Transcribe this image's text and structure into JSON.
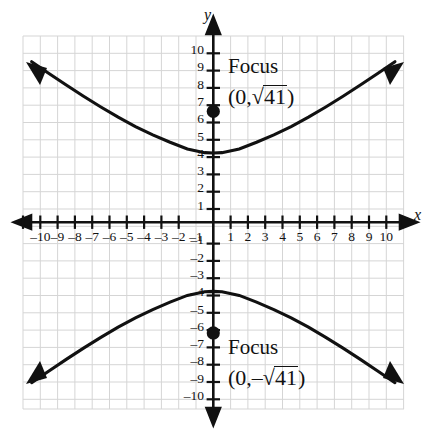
{
  "figure": {
    "title": "",
    "background_color": "#ffffff",
    "grid_color": "#d5d5d5",
    "axis_color": "#111111",
    "curve_color": "#111111"
  },
  "axes": {
    "x_name": "x",
    "y_name": "y",
    "x_ticks": [
      -10,
      -9,
      -8,
      -7,
      -6,
      -5,
      -4,
      -3,
      -2,
      -1,
      1,
      2,
      3,
      4,
      5,
      6,
      7,
      8,
      9,
      10
    ],
    "y_ticks": [
      10,
      9,
      8,
      7,
      6,
      5,
      4,
      3,
      2,
      1,
      -1,
      -2,
      -3,
      -4,
      -5,
      -6,
      -7,
      -8,
      -9,
      -10
    ],
    "x_tick_labels": [
      "–10",
      "–9",
      "–8",
      "–7",
      "–6",
      "–5",
      "–4",
      "–3",
      "–2",
      "–1",
      "1",
      "2",
      "3",
      "4",
      "5",
      "6",
      "7",
      "8",
      "9",
      "10"
    ],
    "y_tick_labels": [
      "10",
      "9",
      "8",
      "7",
      "6",
      "5",
      "4",
      "3",
      "2",
      "1",
      "–1",
      "–2",
      "–3",
      "–4",
      "–5",
      "–6",
      "–7",
      "–8",
      "–9",
      "–10"
    ]
  },
  "annotations": {
    "focus_top": {
      "label": "Focus",
      "coord_open": "(0,",
      "coord_sign": "",
      "radical_symbol": "√",
      "radicand": "41",
      "coord_close": ")"
    },
    "focus_bottom": {
      "label": "Focus",
      "coord_open": "(0,",
      "coord_sign": "–",
      "radical_symbol": "√",
      "radicand": "41",
      "coord_close": ")"
    }
  },
  "chart_data": {
    "type": "line",
    "title": "",
    "xlabel": "x",
    "ylabel": "y",
    "xlim": [
      -11,
      11
    ],
    "ylim": [
      -11,
      11
    ],
    "grid": true,
    "legend": "none",
    "equation": "y^2/16 - x^2/25 = 1",
    "a": 4,
    "b": 5,
    "c": 6.403,
    "vertices": [
      [
        0,
        4
      ],
      [
        0,
        -4
      ]
    ],
    "foci": [
      [
        0,
        6.403
      ],
      [
        0,
        -6.403
      ]
    ],
    "focus_labels": [
      "(0, √41)",
      "(0, –√41)"
    ],
    "points": [
      {
        "name": "focus-upper",
        "x": 0,
        "y": 6.403,
        "marker": "filled-circle"
      },
      {
        "name": "focus-lower",
        "x": 0,
        "y": -6.403,
        "marker": "filled-circle"
      }
    ],
    "series": [
      {
        "name": "upper-branch",
        "x": [
          -10.5,
          -9.5,
          -8.5,
          -7.5,
          -6.5,
          -5.5,
          -4.5,
          -3.5,
          -2.5,
          -1.5,
          -0.5,
          0,
          0.5,
          1.5,
          2.5,
          3.5,
          4.5,
          5.5,
          6.5,
          7.5,
          8.5,
          9.5,
          10.5
        ],
        "y": [
          9.28,
          8.6,
          7.93,
          7.28,
          6.66,
          6.07,
          5.53,
          5.05,
          4.62,
          4.23,
          4.02,
          4.0,
          4.02,
          4.23,
          4.62,
          5.05,
          5.53,
          6.07,
          6.66,
          7.28,
          7.93,
          8.6,
          9.28
        ],
        "arrows": [
          "start",
          "end"
        ]
      },
      {
        "name": "lower-branch",
        "x": [
          -10.5,
          -9.5,
          -8.5,
          -7.5,
          -6.5,
          -5.5,
          -4.5,
          -3.5,
          -2.5,
          -1.5,
          -0.5,
          0,
          0.5,
          1.5,
          2.5,
          3.5,
          4.5,
          5.5,
          6.5,
          7.5,
          8.5,
          9.5,
          10.5
        ],
        "y": [
          -9.28,
          -8.6,
          -7.93,
          -7.28,
          -6.66,
          -6.07,
          -5.53,
          -5.05,
          -4.62,
          -4.23,
          -4.02,
          -4.0,
          -4.02,
          -4.23,
          -4.62,
          -5.05,
          -5.53,
          -6.07,
          -6.66,
          -7.28,
          -7.93,
          -8.6,
          -9.28
        ],
        "arrows": [
          "start",
          "end"
        ]
      }
    ]
  }
}
